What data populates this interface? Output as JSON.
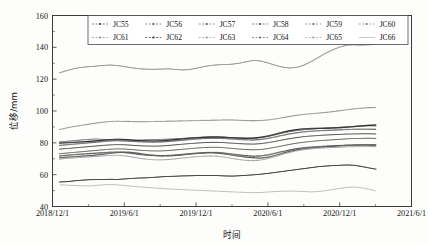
{
  "figure": {
    "background": "#fdfdfb",
    "frame_color": "#3a3a3a"
  },
  "chart_data": {
    "type": "line",
    "title": "",
    "xlabel": "时间",
    "ylabel": "位移/mm",
    "ylim": [
      40,
      160
    ],
    "yticks": [
      40,
      60,
      80,
      100,
      120,
      140,
      160
    ],
    "xticks": [
      "2018/12/1",
      "2019/6/1",
      "2019/12/1",
      "2020/6/1",
      "2020/12/1",
      "2021/6/1"
    ],
    "xlim": [
      "2018/12/1",
      "2021/6/1"
    ],
    "grid": false,
    "legend_position": "top-center",
    "legend_columns": 6,
    "legend_rows": 2,
    "x_months": [
      0.6,
      1.2,
      1.8,
      2.4,
      3,
      3.6,
      4.2,
      4.8,
      5.4,
      6,
      6.6,
      7.2,
      7.8,
      8.4,
      9,
      9.6,
      10.2,
      10.8,
      11.4,
      12,
      12.6,
      13.2,
      13.8,
      14.4,
      15,
      15.6,
      16.2,
      16.8,
      17.4,
      18,
      18.6,
      19.2,
      19.8,
      20.4,
      21,
      21.6,
      22.2,
      22.8,
      23.4,
      24,
      24.6,
      25.2,
      25.8,
      26.4,
      27
    ],
    "series": [
      {
        "name": "JC55",
        "marker": "dot-dash",
        "color": "#3b3b3b",
        "values": [
          55.4,
          55.6,
          56.1,
          56.5,
          56.8,
          56.9,
          57.0,
          57.1,
          57.0,
          57.3,
          57.6,
          57.9,
          58.0,
          58.3,
          58.6,
          58.9,
          59.0,
          59.2,
          59.3,
          59.4,
          59.5,
          59.5,
          59.4,
          59.2,
          59.1,
          59.3,
          59.6,
          59.9,
          60.3,
          60.8,
          61.4,
          62.0,
          62.6,
          63.2,
          63.8,
          64.4,
          65.0,
          65.4,
          65.7,
          65.9,
          66.1,
          65.9,
          65.2,
          64.3,
          63.5
        ]
      },
      {
        "name": "JC56",
        "marker": "dot",
        "color": "#5a5a5a",
        "values": [
          70.6,
          71.0,
          71.3,
          71.6,
          71.9,
          72.3,
          72.8,
          73.4,
          73.9,
          74.2,
          74.0,
          73.4,
          72.7,
          72.2,
          71.9,
          71.8,
          72.0,
          72.4,
          72.9,
          73.3,
          73.6,
          73.8,
          73.6,
          73.0,
          72.3,
          71.6,
          71.0,
          70.6,
          70.4,
          71.0,
          72.1,
          73.4,
          74.6,
          75.6,
          76.3,
          76.8,
          77.2,
          77.5,
          77.8,
          78.1,
          78.4,
          78.6,
          78.7,
          78.7,
          78.6
        ]
      },
      {
        "name": "JC57",
        "marker": "cross",
        "color": "#636363",
        "values": [
          73.2,
          73.6,
          74.0,
          74.4,
          74.8,
          75.2,
          75.6,
          76.0,
          76.2,
          76.1,
          75.8,
          75.4,
          75.1,
          74.9,
          74.9,
          75.1,
          75.5,
          75.9,
          76.3,
          76.7,
          77.0,
          77.2,
          77.2,
          76.9,
          76.5,
          76.1,
          75.8,
          75.6,
          75.8,
          76.4,
          77.2,
          78.1,
          79.0,
          79.8,
          80.4,
          80.9,
          81.3,
          81.6,
          81.9,
          82.2,
          82.5,
          82.7,
          82.8,
          82.9,
          82.8
        ]
      },
      {
        "name": "JC58",
        "marker": "plus",
        "color": "#4e4e4e",
        "values": [
          76.1,
          76.4,
          76.8,
          77.2,
          77.6,
          78.0,
          78.4,
          78.7,
          78.9,
          78.8,
          78.5,
          78.2,
          78.0,
          77.9,
          78.0,
          78.3,
          78.7,
          79.1,
          79.5,
          79.8,
          80.1,
          80.3,
          80.3,
          80.1,
          79.8,
          79.5,
          79.3,
          79.2,
          79.5,
          80.1,
          80.9,
          81.8,
          82.6,
          83.3,
          83.9,
          84.3,
          84.6,
          84.9,
          85.1,
          85.3,
          85.5,
          85.6,
          85.7,
          85.7,
          85.6
        ]
      },
      {
        "name": "JC59",
        "marker": "dot",
        "color": "#717171",
        "values": [
          78.4,
          78.8,
          79.2,
          79.6,
          80.0,
          80.4,
          80.8,
          81.2,
          81.4,
          81.3,
          81.0,
          80.7,
          80.5,
          80.4,
          80.5,
          80.8,
          81.2,
          81.6,
          82.0,
          82.4,
          82.7,
          82.9,
          82.9,
          82.7,
          82.4,
          82.1,
          81.9,
          81.8,
          82.1,
          82.8,
          83.7,
          84.7,
          85.6,
          86.3,
          86.9,
          87.3,
          87.6,
          87.8,
          88.0,
          88.2,
          88.4,
          88.5,
          88.6,
          88.6,
          88.5
        ]
      },
      {
        "name": "JC60",
        "marker": "dash",
        "color": "#808080",
        "values": [
          80.6,
          81.0,
          81.4,
          81.8,
          82.2,
          82.4,
          82.2,
          81.8,
          81.4,
          81.2,
          81.3,
          81.6,
          81.9,
          82.1,
          82.2,
          82.3,
          82.5,
          82.8,
          83.1,
          83.4,
          83.6,
          83.8,
          83.8,
          83.6,
          83.3,
          83.0,
          82.8,
          82.8,
          83.2,
          84.0,
          85.0,
          86.1,
          87.0,
          87.7,
          88.2,
          88.6,
          88.9,
          89.2,
          89.5,
          89.8,
          90.1,
          90.4,
          90.6,
          90.7,
          90.6
        ]
      },
      {
        "name": "JC61",
        "marker": "dot-small",
        "color": "#8a8a8a",
        "values": [
          88.4,
          89.4,
          90.3,
          91.0,
          91.7,
          92.4,
          93.0,
          93.4,
          93.6,
          93.5,
          93.4,
          93.3,
          93.3,
          93.4,
          93.5,
          93.6,
          93.7,
          93.8,
          93.9,
          94.0,
          94.1,
          94.2,
          94.3,
          94.4,
          94.4,
          94.2,
          94.0,
          93.9,
          94.0,
          94.4,
          95.0,
          95.8,
          96.6,
          97.3,
          97.9,
          98.3,
          98.7,
          99.1,
          99.6,
          100.2,
          100.8,
          101.4,
          101.8,
          102.1,
          102.2
        ]
      },
      {
        "name": "JC62",
        "marker": "square",
        "color": "#2d2d2d",
        "values": [
          79.8,
          80.1,
          80.3,
          80.6,
          80.9,
          81.2,
          81.6,
          82.0,
          82.2,
          82.1,
          81.8,
          81.5,
          81.3,
          81.2,
          81.3,
          81.6,
          82.0,
          82.4,
          82.8,
          83.1,
          83.4,
          83.6,
          83.6,
          83.4,
          83.2,
          83.0,
          82.9,
          83.0,
          83.5,
          84.3,
          85.4,
          86.6,
          87.6,
          88.3,
          88.8,
          89.0,
          89.1,
          89.2,
          89.3,
          89.5,
          89.8,
          90.2,
          90.6,
          91.0,
          91.2
        ]
      },
      {
        "name": "JC63",
        "marker": "dot-dash",
        "color": "#969696",
        "values": [
          124.0,
          125.4,
          126.6,
          127.4,
          127.8,
          128.2,
          128.6,
          128.9,
          128.6,
          127.9,
          127.2,
          126.6,
          126.3,
          126.2,
          126.3,
          126.5,
          126.2,
          125.8,
          126.0,
          126.8,
          127.8,
          128.6,
          129.0,
          129.2,
          129.4,
          130.0,
          131.0,
          131.8,
          131.4,
          130.2,
          128.8,
          127.6,
          127.0,
          127.4,
          128.8,
          131.0,
          133.6,
          136.2,
          138.4,
          140.2,
          141.4,
          141.6,
          141.4,
          141.6,
          141.8
        ]
      },
      {
        "name": "JC64",
        "marker": "dot",
        "color": "#5f5f5f",
        "values": [
          71.8,
          72.2,
          72.6,
          72.9,
          73.2,
          73.5,
          73.8,
          74.1,
          74.2,
          73.9,
          73.4,
          72.8,
          72.3,
          72.0,
          71.9,
          72.0,
          72.3,
          72.7,
          73.1,
          73.5,
          73.8,
          74.0,
          73.9,
          73.5,
          73.0,
          72.4,
          71.9,
          71.6,
          71.8,
          72.4,
          73.4,
          74.5,
          75.5,
          76.3,
          76.9,
          77.3,
          77.6,
          77.9,
          78.1,
          78.3,
          78.5,
          78.6,
          78.7,
          78.7,
          78.6
        ]
      },
      {
        "name": "JC65",
        "marker": "dot-light",
        "color": "#9e9e9e",
        "values": [
          69.8,
          70.2,
          70.6,
          70.9,
          71.2,
          71.5,
          71.8,
          72.1,
          72.2,
          71.9,
          71.2,
          70.4,
          69.8,
          69.4,
          69.3,
          69.5,
          69.9,
          70.4,
          70.9,
          71.3,
          71.6,
          71.8,
          71.6,
          71.0,
          70.2,
          69.5,
          69.0,
          68.8,
          69.2,
          70.1,
          71.4,
          72.8,
          74.0,
          75.0,
          75.7,
          76.2,
          76.6,
          76.9,
          77.1,
          77.3,
          77.5,
          77.6,
          77.7,
          77.7,
          77.6
        ]
      },
      {
        "name": "JC66",
        "marker": "line",
        "color": "#b0b0b0",
        "values": [
          53.6,
          53.4,
          53.2,
          53.0,
          52.9,
          53.2,
          53.6,
          53.8,
          53.6,
          53.2,
          52.8,
          52.4,
          52.0,
          51.7,
          51.4,
          51.1,
          50.8,
          50.6,
          50.4,
          50.2,
          50.0,
          49.8,
          49.6,
          49.4,
          49.2,
          49.0,
          48.8,
          48.7,
          48.8,
          49.1,
          49.4,
          49.6,
          49.7,
          49.6,
          49.4,
          49.2,
          49.4,
          49.9,
          50.6,
          51.4,
          52.0,
          52.2,
          51.8,
          50.9,
          49.8
        ]
      }
    ]
  },
  "legend": {
    "entries": [
      {
        "label": "JC55"
      },
      {
        "label": "JC56"
      },
      {
        "label": "JC57"
      },
      {
        "label": "JC58"
      },
      {
        "label": "JC59"
      },
      {
        "label": "JC60"
      },
      {
        "label": "JC61"
      },
      {
        "label": "JC62"
      },
      {
        "label": "JC63"
      },
      {
        "label": "JC64"
      },
      {
        "label": "JC65"
      },
      {
        "label": "JC66"
      }
    ]
  }
}
